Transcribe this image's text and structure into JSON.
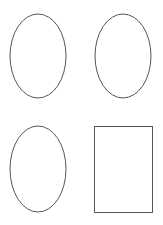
{
  "canvas": {
    "width": 163,
    "height": 225,
    "background": "#ffffff"
  },
  "stroke_color": "#555555",
  "shapes": [
    {
      "type": "ellipse",
      "cx": 38,
      "cy": 56,
      "rx": 28,
      "ry": 42
    },
    {
      "type": "ellipse",
      "cx": 123,
      "cy": 56,
      "rx": 28,
      "ry": 42
    },
    {
      "type": "ellipse",
      "cx": 38,
      "cy": 169,
      "rx": 28,
      "ry": 43
    },
    {
      "type": "rectangle",
      "x": 94,
      "y": 126,
      "width": 58,
      "height": 86
    }
  ]
}
